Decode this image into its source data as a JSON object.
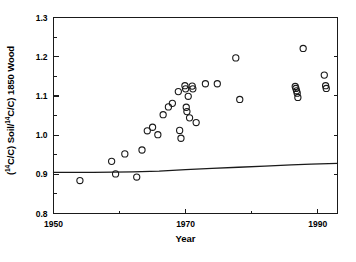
{
  "chart_data": {
    "type": "scatter",
    "title": "",
    "xlabel": "Year",
    "ylabel": "(14C/C) Soil/(14C/C) 1850 Wood",
    "ylabel_parts": {
      "prefix": "(",
      "sup1": "14",
      "mid": "C/C) Soil/",
      "sup2": "14",
      "suffix": "C/C) 1850 Wood"
    },
    "xlim": [
      1950,
      1993
    ],
    "ylim": [
      0.8,
      1.3
    ],
    "xticks": [
      1950,
      1970,
      1990
    ],
    "xtick_labels": [
      "1950",
      "1970",
      "1990"
    ],
    "xminor_ticks": [
      1960,
      1980
    ],
    "yticks": [
      0.8,
      0.9,
      1.0,
      1.1,
      1.2,
      1.3
    ],
    "ytick_labels": [
      "0.8",
      "0.9",
      "1.0",
      "1.1",
      "1.2",
      "1.3"
    ],
    "yminor_ticks": [
      0.85,
      0.95,
      1.05,
      1.15,
      1.25
    ],
    "grid": false,
    "legend": null,
    "marker": "open-circle",
    "marker_color": "#1a1a1a",
    "series": [
      {
        "name": "Soil radiocarbon measurements",
        "points": [
          [
            1954.0,
            0.884
          ],
          [
            1958.8,
            0.933
          ],
          [
            1959.4,
            0.901
          ],
          [
            1960.8,
            0.952
          ],
          [
            1962.6,
            0.893
          ],
          [
            1963.4,
            0.962
          ],
          [
            1964.2,
            1.011
          ],
          [
            1965.0,
            1.02
          ],
          [
            1965.8,
            1.001
          ],
          [
            1966.6,
            1.052
          ],
          [
            1967.4,
            1.072
          ],
          [
            1968.0,
            1.081
          ],
          [
            1968.9,
            1.111
          ],
          [
            1969.1,
            1.012
          ],
          [
            1969.3,
            0.992
          ],
          [
            1969.9,
            1.126
          ],
          [
            1970.0,
            1.118
          ],
          [
            1970.1,
            1.071
          ],
          [
            1970.2,
            1.06
          ],
          [
            1970.4,
            1.099
          ],
          [
            1970.6,
            1.044
          ],
          [
            1971.0,
            1.125
          ],
          [
            1971.1,
            1.118
          ],
          [
            1971.6,
            1.032
          ],
          [
            1973.0,
            1.131
          ],
          [
            1974.8,
            1.131
          ],
          [
            1977.6,
            1.197
          ],
          [
            1978.2,
            1.091
          ],
          [
            1986.6,
            1.124
          ],
          [
            1986.7,
            1.119
          ],
          [
            1986.8,
            1.113
          ],
          [
            1986.9,
            1.107
          ],
          [
            1987.0,
            1.096
          ],
          [
            1987.8,
            1.221
          ],
          [
            1991.0,
            1.153
          ],
          [
            1991.2,
            1.126
          ],
          [
            1991.3,
            1.119
          ]
        ]
      }
    ],
    "trend_line": {
      "name": "Atmospheric / model reference curve",
      "points": [
        [
          1950.0,
          0.905
        ],
        [
          1956.0,
          0.905
        ],
        [
          1962.0,
          0.906
        ],
        [
          1966.0,
          0.908
        ],
        [
          1970.0,
          0.912
        ],
        [
          1974.0,
          0.915
        ],
        [
          1978.0,
          0.918
        ],
        [
          1982.0,
          0.921
        ],
        [
          1986.0,
          0.924
        ],
        [
          1989.0,
          0.926
        ],
        [
          1993.0,
          0.928
        ]
      ]
    }
  },
  "axes": {
    "x_title": "Year",
    "y_title": "(14C/C) Soil/(14C/C) 1850 Wood"
  }
}
